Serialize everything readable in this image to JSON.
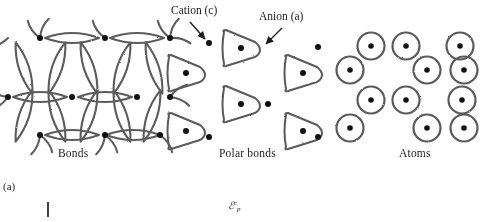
{
  "figure": {
    "subfigure_label": "(a)",
    "background_color": "#ffffff",
    "ink_color": "#4a4a4a",
    "dot_color": "#111111"
  },
  "panels": [
    {
      "id": "bonds",
      "label": "Bonds",
      "motif": "lens-bond-network"
    },
    {
      "id": "polar",
      "label": "Polar bonds",
      "motif": "rounded-triangle-anion-with-cation-dots"
    },
    {
      "id": "atoms",
      "label": "Atoms",
      "motif": "stippled-circle-with-center-dot"
    }
  ],
  "callouts": [
    {
      "id": "cation",
      "text": "Cation (c)",
      "arrow": "down-right",
      "points_to": "small-black-dot"
    },
    {
      "id": "anion",
      "text": "Anion (a)",
      "arrow": "down-left",
      "points_to": "rounded-triangle"
    }
  ],
  "axis": {
    "symbol_base": "ℰ",
    "symbol_subscript": "p",
    "symbol_superscript": "c",
    "tick_mark": "|"
  },
  "geometry": {
    "bond_nodes": [
      [
        40,
        38
      ],
      [
        105,
        38
      ],
      [
        170,
        38
      ],
      [
        8,
        97
      ],
      [
        72,
        97
      ],
      [
        137,
        97
      ],
      [
        40,
        135
      ],
      [
        105,
        135
      ],
      [
        160,
        135
      ]
    ],
    "anion_triangles": [
      [
        241,
        48
      ],
      [
        180,
        100
      ],
      [
        305,
        100
      ],
      [
        241,
        131
      ],
      [
        180,
        60
      ],
      [
        305,
        60
      ]
    ],
    "cation_dots": [
      [
        208,
        42
      ],
      [
        318,
        46
      ],
      [
        268,
        103
      ],
      [
        208,
        137
      ],
      [
        318,
        137
      ]
    ],
    "atom_circles": [
      [
        369,
        46
      ],
      [
        401,
        46
      ],
      [
        458,
        46
      ],
      [
        345,
        68
      ],
      [
        394,
        70
      ],
      [
        429,
        70
      ],
      [
        368,
        100
      ],
      [
        400,
        100
      ],
      [
        455,
        102
      ],
      [
        344,
        127
      ],
      [
        394,
        128
      ],
      [
        429,
        128
      ]
    ]
  }
}
